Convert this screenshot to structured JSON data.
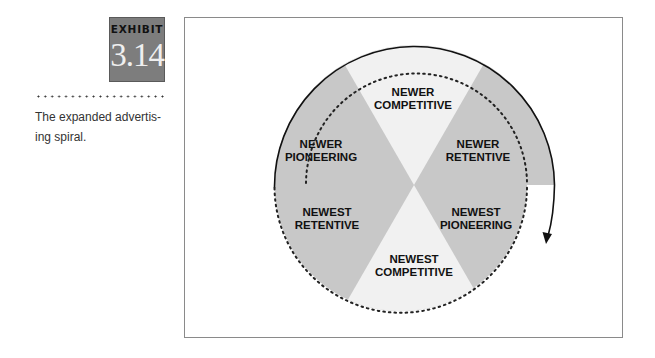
{
  "exhibit": {
    "label": "EXHIBIT",
    "number": "3.14"
  },
  "caption": {
    "line1": "The expanded advertis-",
    "line2": "ing spiral."
  },
  "diagram": {
    "colors": {
      "dark_wedge": "#c8c8c8",
      "light_wedge": "#f1f1f1",
      "badge": "#7d7d7d",
      "outline": "#111111"
    },
    "segments": [
      {
        "line1": "NEWER",
        "line2": "COMPETITIVE",
        "shade": "light"
      },
      {
        "line1": "NEWER",
        "line2": "RETENTIVE",
        "shade": "dark"
      },
      {
        "line1": "NEWEST",
        "line2": "PIONEERING",
        "shade": "dark"
      },
      {
        "line1": "NEWEST",
        "line2": "COMPETITIVE",
        "shade": "light"
      },
      {
        "line1": "NEWEST",
        "line2": "RETENTIVE",
        "shade": "dark"
      },
      {
        "line1": "NEWER",
        "line2": "PIONEERING",
        "shade": "dark"
      }
    ],
    "direction": "clockwise spiral arrow"
  }
}
